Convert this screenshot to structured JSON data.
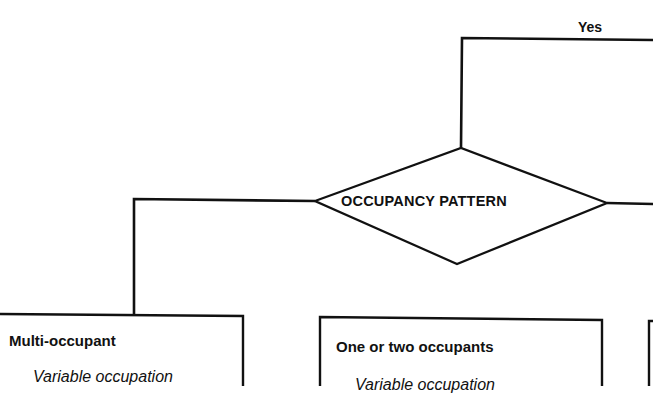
{
  "diagram": {
    "type": "flowchart",
    "branch_labels": {
      "yes": "Yes"
    },
    "decision": {
      "label": "OCCUPANCY PATTERN"
    },
    "outcomes": [
      {
        "title": "Multi-occupant",
        "body": "Variable occupation"
      },
      {
        "title": "One or two occupants",
        "body": "Variable occupation"
      },
      {
        "title": "",
        "body": ""
      }
    ],
    "colors": {
      "line": "#111111",
      "background": "#ffffff"
    }
  }
}
